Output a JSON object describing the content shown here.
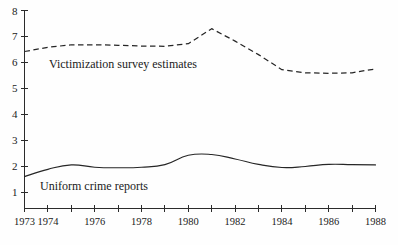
{
  "chart_data": {
    "type": "line",
    "title": "",
    "subtitle": "",
    "xlabel": "",
    "ylabel": "",
    "xlim": [
      1973,
      1988
    ],
    "ylim": [
      0.37,
      8.0
    ],
    "grid": false,
    "legend_position": "inline-annotation",
    "x": [
      1973,
      1974,
      1975,
      1976,
      1977,
      1978,
      1979,
      1980,
      1981,
      1982,
      1983,
      1984,
      1985,
      1986,
      1987,
      1988
    ],
    "y_ticks": [
      1,
      2,
      3,
      4,
      5,
      6,
      7,
      8
    ],
    "y_tick_labels": [
      "1",
      "2",
      "3",
      "4",
      "5",
      "6",
      "7",
      "8"
    ],
    "x_ticks": [
      1973,
      1974,
      1975,
      1976,
      1977,
      1978,
      1979,
      1980,
      1981,
      1982,
      1983,
      1984,
      1985,
      1986,
      1987,
      1988
    ],
    "x_tick_labels": [
      "1973",
      "1974",
      "",
      "1976",
      "",
      "1978",
      "",
      "1980",
      "",
      "1982",
      "",
      "1984",
      "",
      "1986",
      "",
      "1988"
    ],
    "series": [
      {
        "name": "Victimization survey estimates",
        "style": "dashed",
        "color": "#262626",
        "annotation": "Victimization survey estimates",
        "values": [
          6.42,
          6.58,
          6.68,
          6.68,
          6.66,
          6.63,
          6.62,
          6.72,
          7.3,
          6.82,
          6.3,
          5.72,
          5.6,
          5.58,
          5.6,
          5.75
        ]
      },
      {
        "name": "Uniform crime reports",
        "style": "solid",
        "color": "#262626",
        "annotation": "Uniform crime reports",
        "values": [
          1.6,
          1.88,
          2.05,
          1.96,
          1.94,
          1.96,
          2.06,
          2.42,
          2.45,
          2.28,
          2.07,
          1.95,
          1.99,
          2.07,
          2.06,
          2.05
        ]
      }
    ]
  },
  "annotations": {
    "victimization_label": "Victimization survey estimates",
    "uniform_label": "Uniform crime reports"
  },
  "colors": {
    "line": "#262626",
    "axis": "#2b2b2b",
    "background": "#fefefe"
  }
}
